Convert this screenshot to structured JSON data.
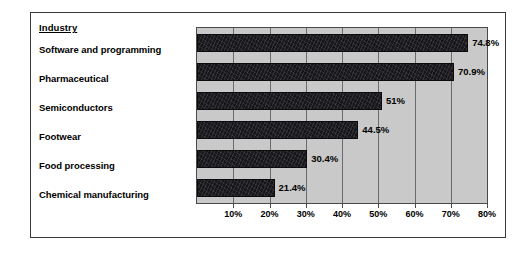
{
  "chart_data": {
    "type": "bar",
    "orientation": "horizontal",
    "title": "",
    "xlabel": "",
    "ylabel": "Industry",
    "legend": null,
    "grid": true,
    "xlim": [
      0,
      80
    ],
    "xtick_labels": [
      "10%",
      "20%",
      "30%",
      "40%",
      "50%",
      "60%",
      "70%",
      "80%"
    ],
    "xtick_values": [
      10,
      20,
      30,
      40,
      50,
      60,
      70,
      80
    ],
    "categories": [
      "Software and programming",
      "Pharmaceutical",
      "Semiconductors",
      "Footwear",
      "Food processing",
      "Chemical manufacturing"
    ],
    "values": [
      74.8,
      70.9,
      51,
      44.5,
      30.4,
      21.4
    ],
    "value_labels": [
      "74.8%",
      "70.9%",
      "51%",
      "44.5%",
      "30.4%",
      "21.4%"
    ],
    "colors": {
      "bar": "#16161a",
      "plot_background": "#c9c9c9",
      "gridline": "#6b6b6b",
      "axis": "#4a4a4a",
      "text": "#000000",
      "frame": "#3a3a3a",
      "page_background": "#ffffff"
    }
  },
  "header": {
    "industry_label": "Industry"
  }
}
